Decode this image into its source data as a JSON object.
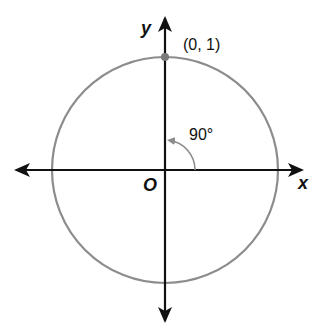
{
  "diagram": {
    "type": "unit-circle",
    "axes": {
      "x_label": "x",
      "y_label": "y",
      "origin_label": "O"
    },
    "point": {
      "label": "(0, 1)",
      "x": 0,
      "y": 1
    },
    "angle": {
      "label": "90°",
      "degrees": 90
    },
    "colors": {
      "circle": "#8c8c8c",
      "axes": "#111111",
      "point": "#7a7a7a",
      "arc": "#8c8c8c"
    }
  }
}
